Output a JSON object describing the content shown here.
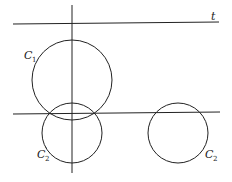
{
  "diagram": {
    "lines": [
      {
        "id": "line-t",
        "x1": 13,
        "y1": 24,
        "x2": 219,
        "y2": 22,
        "label": "t"
      },
      {
        "id": "vertical-line",
        "x1": 72,
        "y1": 5,
        "x2": 72,
        "y2": 173
      },
      {
        "id": "horizontal-line",
        "x1": 13,
        "y1": 114,
        "x2": 220,
        "y2": 112
      }
    ],
    "circles": [
      {
        "id": "C1",
        "cx": 72,
        "cy": 80,
        "r": 40,
        "label": "C",
        "subscript": "1",
        "prime": ""
      },
      {
        "id": "C2-prime",
        "cx": 72,
        "cy": 133,
        "r": 30,
        "label": "C",
        "subscript": "2",
        "prime": "′"
      },
      {
        "id": "C2",
        "cx": 178,
        "cy": 133,
        "r": 30,
        "label": "C",
        "subscript": "2",
        "prime": ""
      }
    ],
    "labels": {
      "t": "t",
      "c1_main": "C",
      "c1_sub": "1",
      "c2prime_main": "C",
      "c2prime_prime": "′",
      "c2prime_sub": "2",
      "c2_main": "C",
      "c2_sub": "2"
    },
    "color": "#222222"
  }
}
